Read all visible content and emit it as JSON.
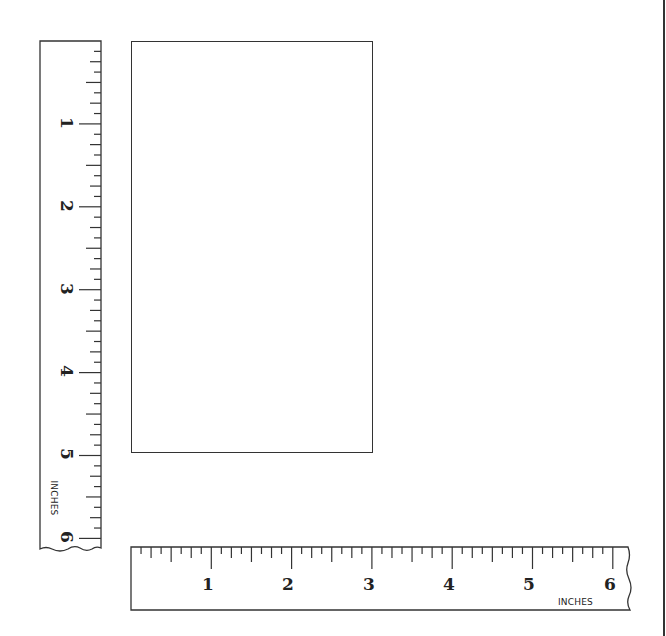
{
  "diagram": {
    "type": "measurement-figure",
    "colors": {
      "line": "#333333",
      "background": "#ffffff",
      "text": "#222222"
    }
  },
  "vertical_ruler": {
    "units_label": "INCHES",
    "labels": [
      "1",
      "2",
      "3",
      "4",
      "5",
      "6"
    ],
    "range_inches": [
      0,
      6
    ],
    "subdivisions_per_inch": 8
  },
  "horizontal_ruler": {
    "units_label": "INCHES",
    "labels": [
      "1",
      "2",
      "3",
      "4",
      "5",
      "6"
    ],
    "range_inches": [
      0,
      6
    ],
    "subdivisions_per_inch": 8
  },
  "rectangle": {
    "description": "Rectangle to be measured",
    "approx_width_inches": 3,
    "approx_height_inches": 5
  }
}
